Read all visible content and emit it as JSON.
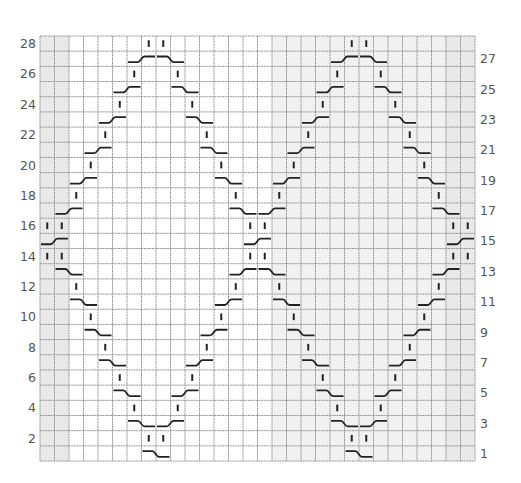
{
  "chart_data": {
    "type": "table",
    "title": "",
    "grid": {
      "columns": 30,
      "rows": 28,
      "x0": 40,
      "y0": 36,
      "cell_width": 14.5,
      "cell_height": 15.18,
      "shaded_columns": [
        0,
        1,
        16,
        17,
        18,
        19,
        20,
        21,
        22,
        23,
        24,
        25,
        26,
        27,
        28,
        29
      ],
      "edge_shaded_columns": [
        0,
        1,
        28,
        29
      ]
    },
    "colors": {
      "grid_line": "#9a9a9a",
      "shade": "#f1f1f1",
      "edge_shade": "#e9e9e9",
      "stitch": "#222222",
      "label": "#555555"
    },
    "left_labels": [
      "2",
      "4",
      "6",
      "8",
      "10",
      "12",
      "14",
      "16",
      "18",
      "20",
      "22",
      "24",
      "26",
      "28"
    ],
    "right_labels": [
      "1",
      "3",
      "5",
      "7",
      "9",
      "11",
      "13",
      "15",
      "17",
      "19",
      "21",
      "23",
      "25",
      "27"
    ],
    "legend": {
      "I": "knit stitch (vertical bar)",
      "L": "cable cross rising to the right (_/ spanning 2 columns)",
      "R": "cable cross descending to the right (\\_ spanning 2 columns)"
    },
    "rows": [
      {
        "row": 1,
        "I": [],
        "L": [],
        "R": [
          7,
          21
        ]
      },
      {
        "row": 2,
        "I": [
          7,
          8,
          21,
          22
        ],
        "L": [],
        "R": []
      },
      {
        "row": 3,
        "I": [],
        "L": [
          8,
          22
        ],
        "R": [
          6,
          20
        ]
      },
      {
        "row": 4,
        "I": [
          6,
          9,
          20,
          23
        ],
        "L": [],
        "R": []
      },
      {
        "row": 5,
        "I": [],
        "L": [
          9,
          23
        ],
        "R": [
          5,
          19
        ]
      },
      {
        "row": 6,
        "I": [
          5,
          10,
          19,
          24
        ],
        "L": [],
        "R": []
      },
      {
        "row": 7,
        "I": [],
        "L": [
          10,
          24
        ],
        "R": [
          4,
          18
        ]
      },
      {
        "row": 8,
        "I": [
          4,
          11,
          18,
          25
        ],
        "L": [],
        "R": []
      },
      {
        "row": 9,
        "I": [],
        "L": [
          11,
          25
        ],
        "R": [
          3,
          17
        ]
      },
      {
        "row": 10,
        "I": [
          3,
          12,
          17,
          26
        ],
        "L": [],
        "R": []
      },
      {
        "row": 11,
        "I": [],
        "L": [
          12,
          26
        ],
        "R": [
          2,
          16
        ]
      },
      {
        "row": 12,
        "I": [
          2,
          13,
          16,
          27
        ],
        "L": [],
        "R": []
      },
      {
        "row": 13,
        "I": [],
        "L": [
          13,
          27
        ],
        "R": [
          1,
          15
        ]
      },
      {
        "row": 14,
        "I": [
          0,
          1,
          14,
          15,
          28,
          29
        ],
        "L": [],
        "R": []
      },
      {
        "row": 15,
        "I": [],
        "L": [
          0,
          14,
          28
        ],
        "R": []
      },
      {
        "row": 16,
        "I": [
          0,
          1,
          14,
          15,
          28,
          29
        ],
        "L": [],
        "R": []
      },
      {
        "row": 17,
        "I": [],
        "L": [
          1,
          15
        ],
        "R": [
          13,
          27
        ]
      },
      {
        "row": 18,
        "I": [
          2,
          13,
          16,
          27
        ],
        "L": [],
        "R": []
      },
      {
        "row": 19,
        "I": [],
        "L": [
          2,
          16
        ],
        "R": [
          12,
          26
        ]
      },
      {
        "row": 20,
        "I": [
          3,
          12,
          17,
          26
        ],
        "L": [],
        "R": []
      },
      {
        "row": 21,
        "I": [],
        "L": [
          3,
          17
        ],
        "R": [
          11,
          25
        ]
      },
      {
        "row": 22,
        "I": [
          4,
          11,
          18,
          25
        ],
        "L": [],
        "R": []
      },
      {
        "row": 23,
        "I": [],
        "L": [
          4,
          18
        ],
        "R": [
          10,
          24
        ]
      },
      {
        "row": 24,
        "I": [
          5,
          10,
          19,
          24
        ],
        "L": [],
        "R": []
      },
      {
        "row": 25,
        "I": [],
        "L": [
          5,
          19
        ],
        "R": [
          9,
          23
        ]
      },
      {
        "row": 26,
        "I": [
          6,
          9,
          20,
          23
        ],
        "L": [],
        "R": []
      },
      {
        "row": 27,
        "I": [],
        "L": [
          6,
          20
        ],
        "R": [
          8,
          22
        ]
      },
      {
        "row": 28,
        "I": [
          7,
          8,
          21,
          22
        ],
        "L": [],
        "R": []
      }
    ]
  }
}
